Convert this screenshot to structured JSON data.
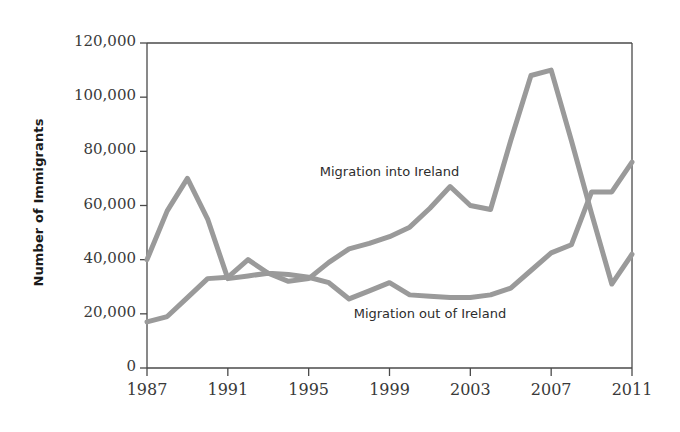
{
  "chart_data": {
    "type": "line",
    "title": "",
    "xlabel": "",
    "ylabel": "Number of Immigrants",
    "xlim": [
      1987,
      2011
    ],
    "ylim": [
      0,
      120000
    ],
    "grid": false,
    "legend_position": "inline-annotation",
    "x": [
      1987,
      1988,
      1989,
      1990,
      1991,
      1992,
      1993,
      1994,
      1995,
      1996,
      1997,
      1998,
      1999,
      2000,
      2001,
      2002,
      2003,
      2004,
      2005,
      2006,
      2007,
      2008,
      2009,
      2010,
      2011
    ],
    "xtick_labels": [
      "1987",
      "1991",
      "1995",
      "1999",
      "2003",
      "2007",
      "2011"
    ],
    "xtick_values": [
      1987,
      1991,
      1995,
      1999,
      2003,
      2007,
      2011
    ],
    "ytick_labels": [
      "0",
      "20,000",
      "40,000",
      "60,000",
      "80,000",
      "100,000",
      "120,000"
    ],
    "ytick_values": [
      0,
      20000,
      40000,
      60000,
      80000,
      100000,
      120000
    ],
    "series": [
      {
        "name": "Migration into Ireland",
        "color": "#9a9a9a",
        "values": [
          40000,
          58000,
          70000,
          55000,
          33000,
          34000,
          35000,
          32000,
          33000,
          39000,
          44000,
          46000,
          48500,
          52000,
          59000,
          67000,
          60000,
          58500,
          84000,
          108000,
          110000,
          84000,
          57000,
          31000,
          42000
        ]
      },
      {
        "name": "Migration out of Ireland",
        "color": "#9a9a9a",
        "values": [
          17000,
          19000,
          26000,
          33000,
          33500,
          40000,
          35000,
          34500,
          33500,
          31500,
          25500,
          28500,
          31500,
          27000,
          26500,
          26000,
          26000,
          27000,
          29500,
          36000,
          42500,
          45500,
          65000,
          65000,
          76000
        ]
      }
    ],
    "annotations": [
      {
        "text": "Migration into Ireland",
        "x": 1999,
        "y": 72000
      },
      {
        "text": "Migration out of Ireland",
        "x": 2001,
        "y": 19500
      }
    ]
  },
  "axis": {
    "y_title": "Number of Immigrants"
  }
}
